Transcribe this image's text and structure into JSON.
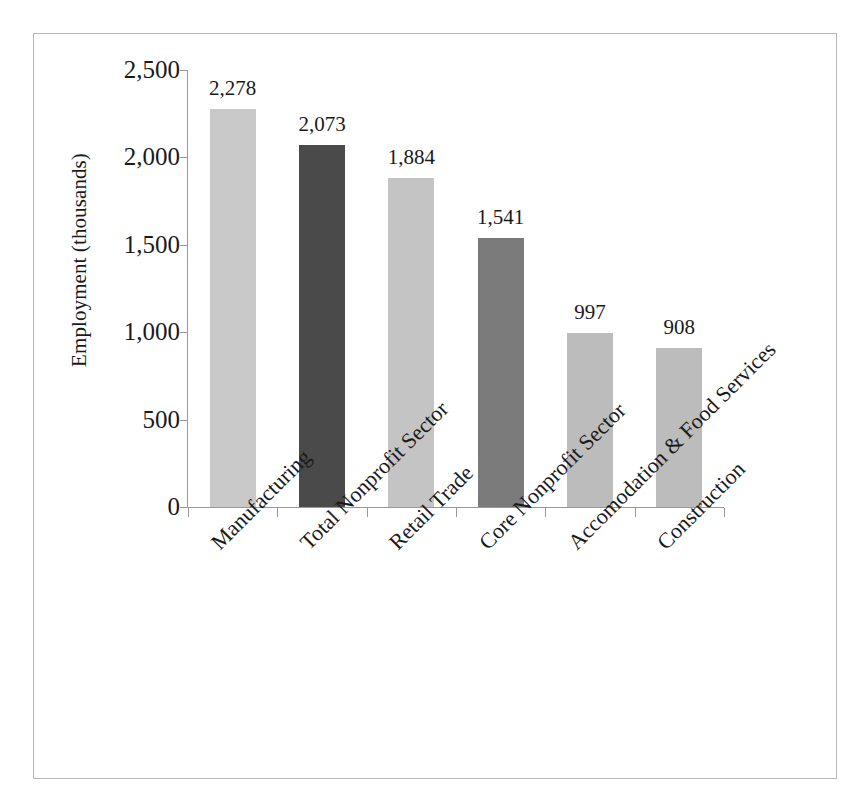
{
  "chart_data": {
    "type": "bar",
    "title": "",
    "xlabel": "",
    "ylabel": "Employment (thousands)",
    "ylim": [
      0,
      2500
    ],
    "ytick_labels": [
      "2,500",
      "2,000",
      "1,500",
      "1,000",
      "500",
      "0"
    ],
    "ytick_values": [
      2500,
      2000,
      1500,
      1000,
      500,
      0
    ],
    "grid": false,
    "legend": "none",
    "categories": [
      "Manufacturing",
      "Total Nonprofit Sector",
      "Retail Trade",
      "Core Nonprofit Sector",
      "Accomodation & Food Services",
      "Construction"
    ],
    "values": [
      2278,
      2073,
      1884,
      1541,
      997,
      908
    ],
    "value_labels": [
      "2,278",
      "2,073",
      "1,884",
      "1,541",
      "997",
      "908"
    ],
    "bar_colors": [
      "#c9c9c9",
      "#4a4a4a",
      "#c4c4c4",
      "#7b7b7b",
      "#bcbcbc",
      "#bcbcbc"
    ]
  },
  "axis": {
    "line_color": "#999999"
  },
  "frame": {
    "border_color": "#b9b9b9"
  }
}
